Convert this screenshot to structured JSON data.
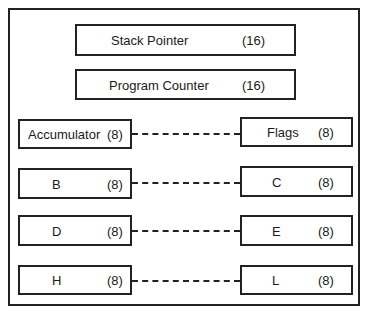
{
  "diagram": {
    "type": "register-set",
    "registers_16": [
      {
        "name": "Stack Pointer",
        "bits": "(16)"
      },
      {
        "name": "Program Counter",
        "bits": "(16)"
      }
    ],
    "register_pairs": [
      {
        "left": {
          "name": "Accumulator",
          "bits": "(8)"
        },
        "right": {
          "name": "Flags",
          "bits": "(8)"
        }
      },
      {
        "left": {
          "name": "B",
          "bits": "(8)"
        },
        "right": {
          "name": "C",
          "bits": "(8)"
        }
      },
      {
        "left": {
          "name": "D",
          "bits": "(8)"
        },
        "right": {
          "name": "E",
          "bits": "(8)"
        }
      },
      {
        "left": {
          "name": "H",
          "bits": "(8)"
        },
        "right": {
          "name": "L",
          "bits": "(8)"
        }
      }
    ],
    "connector_style": "dashed"
  }
}
